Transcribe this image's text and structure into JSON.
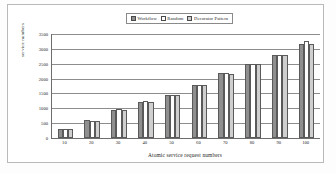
{
  "chart_data": {
    "type": "bar",
    "title": "",
    "xlabel": "Atomic service request numbers",
    "ylabel": "service numbers",
    "categories": [
      "10",
      "20",
      "30",
      "40",
      "50",
      "60",
      "70",
      "80",
      "90",
      "100"
    ],
    "series": [
      {
        "name": "Workflow",
        "values": [
          320,
          590,
          950,
          1210,
          1460,
          1790,
          2180,
          2500,
          2790,
          3160
        ]
      },
      {
        "name": "Random",
        "values": [
          300,
          580,
          960,
          1255,
          1460,
          1800,
          2185,
          2500,
          2800,
          3270
        ]
      },
      {
        "name": "Decorator Pattern",
        "values": [
          315,
          575,
          945,
          1200,
          1455,
          1780,
          2165,
          2490,
          2790,
          3160
        ]
      }
    ],
    "ylim": [
      0,
      3500
    ],
    "yticks": [
      "0",
      "500",
      "1000",
      "1500",
      "2000",
      "2500",
      "3000",
      "3500"
    ],
    "grid": true,
    "legend_position": "top-center",
    "colors": {
      "workflow": "#8f8f8f",
      "random": "#ffffff",
      "decorator_pattern": "#cfcfcf",
      "axis": "#6d6d6d",
      "grid": "#8d8d8d",
      "frame": "#b9b9b9"
    }
  }
}
